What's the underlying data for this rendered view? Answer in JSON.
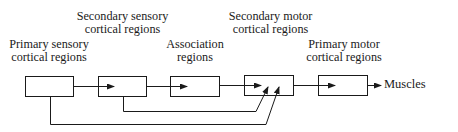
{
  "diagram": {
    "type": "flow",
    "nodes": [
      {
        "id": "primary-sensory",
        "label_lines": [
          "Primary sensory",
          "cortical regions"
        ]
      },
      {
        "id": "secondary-sensory",
        "label_lines": [
          "Secondary sensory",
          "cortical regions"
        ]
      },
      {
        "id": "association",
        "label_lines": [
          "Association",
          "regions"
        ]
      },
      {
        "id": "secondary-motor",
        "label_lines": [
          "Secondary motor",
          "cortical regions"
        ]
      },
      {
        "id": "primary-motor",
        "label_lines": [
          "Primary motor",
          "cortical regions"
        ]
      }
    ],
    "output_label": "Muscles",
    "edges": [
      {
        "from": "primary-sensory",
        "to": "secondary-sensory"
      },
      {
        "from": "secondary-sensory",
        "to": "association"
      },
      {
        "from": "association",
        "to": "secondary-motor"
      },
      {
        "from": "secondary-motor",
        "to": "primary-motor"
      },
      {
        "from": "primary-motor",
        "to": "Muscles"
      },
      {
        "from": "secondary-sensory",
        "to": "secondary-motor"
      },
      {
        "from": "primary-sensory",
        "to": "secondary-motor"
      }
    ],
    "colors": {
      "line": "#1a1a1a",
      "background": "#ffffff"
    }
  }
}
